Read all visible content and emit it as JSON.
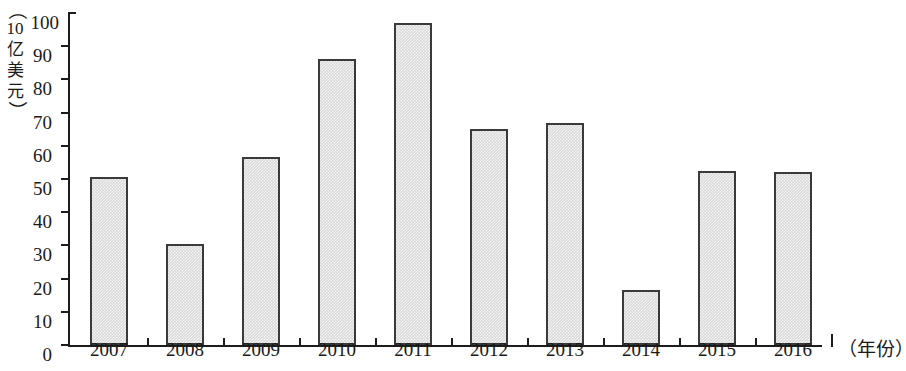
{
  "chart_data": {
    "type": "bar",
    "title": "",
    "subtitle": "",
    "xlabel": "（年份）",
    "ylabel": "（10亿美元）",
    "categories": [
      "2007",
      "2008",
      "2009",
      "2010",
      "2011",
      "2012",
      "2013",
      "2014",
      "2015",
      "2016"
    ],
    "values": [
      50.5,
      30.5,
      56.5,
      86,
      97,
      65,
      67,
      16.5,
      52.5,
      52
    ],
    "ylim": [
      0,
      100
    ],
    "ytick_values": [
      0,
      10,
      20,
      30,
      40,
      50,
      60,
      70,
      80,
      90,
      100
    ],
    "ytick_labels": [
      "0",
      "10",
      "20",
      "30",
      "40",
      "50",
      "60",
      "70",
      "80",
      "90",
      "100"
    ],
    "grid": false,
    "legend": null,
    "legend_position": "none",
    "bar_fill_color": "#d9d9d9",
    "bar_border_color": "#3a3a3a",
    "axis_color": "#1c1c1c"
  },
  "axis_caption": {
    "y_vertical_chars": [
      "（",
      "10",
      "亿",
      "美",
      "元",
      "）"
    ],
    "y_paren_open": "（",
    "y_num": "10",
    "y_char1": "亿",
    "y_char2": "美",
    "y_char3": "元",
    "y_paren_close": "）",
    "x_right": "（年份）"
  }
}
